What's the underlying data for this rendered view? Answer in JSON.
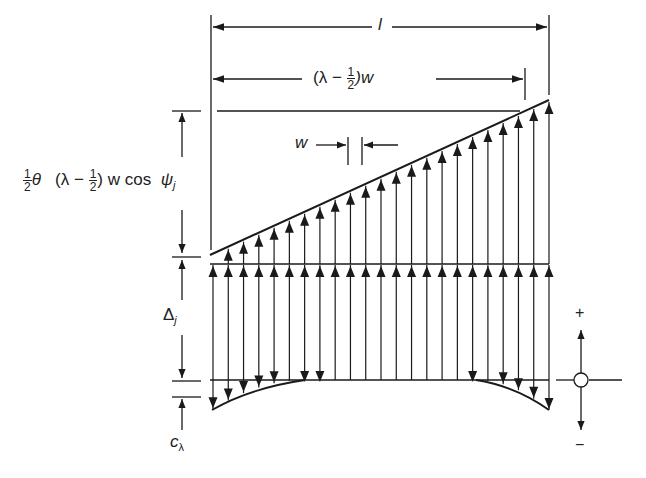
{
  "labels": {
    "total_length": "l",
    "partial_length_prefix": "(λ − ",
    "partial_length_frac_num": "1",
    "partial_length_frac_den": "2",
    "partial_length_suffix": ")w",
    "element_width": "w",
    "rotation_term_frac_num": "1",
    "rotation_term_frac_den": "2",
    "rotation_term_theta": "θ",
    "rotation_term_prefix": "(λ − ",
    "rotation_term_frac2_num": "1",
    "rotation_term_frac2_den": "2",
    "rotation_term_suffix": ") w cos ",
    "rotation_term_psi": "ψ",
    "rotation_term_psi_sub": "j",
    "displacement": "Δ",
    "displacement_sub": "j",
    "crown": "c",
    "crown_sub": "λ",
    "sign_plus": "+",
    "sign_minus": "−"
  },
  "geometry": {
    "left_x": 211,
    "right_x": 549,
    "arrow_count": 23,
    "slope_start_y": 255,
    "slope_end_y": 100,
    "mid_line_y": 264,
    "bottom_line_y": 380,
    "crown_depth": 30,
    "colors": {
      "stroke": "#1a1a1a",
      "background": "#ffffff"
    }
  }
}
